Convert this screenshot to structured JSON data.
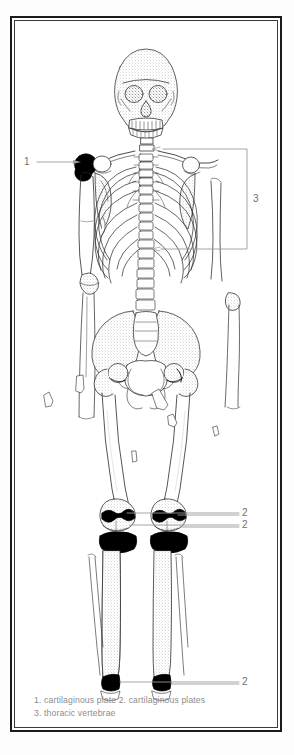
{
  "figure": {
    "kind": "anatomical-line-drawing",
    "background_color": "#ffffff",
    "ink_color": "#2b2b2b",
    "highlight_color": "#000000",
    "label_color": "#6f6f6f",
    "caption_color": "#8c8c8c"
  },
  "labels": [
    {
      "id": "label-1",
      "text": "1",
      "x": 24,
      "y": 141
    },
    {
      "id": "label-3",
      "text": "3",
      "x": 242,
      "y": 186
    },
    {
      "id": "label-2a",
      "text": "2",
      "x": 228,
      "y": 470
    },
    {
      "id": "label-2b",
      "text": "2",
      "x": 228,
      "y": 492
    },
    {
      "id": "label-2c",
      "text": "2",
      "x": 228,
      "y": 645
    }
  ],
  "caption": {
    "line1": "1. cartilaginous plate 2. cartilaginous plates",
    "line2": "3. thoracic vertebrae"
  },
  "legend_keys": [
    {
      "key": "1",
      "term": "cartilaginous plate"
    },
    {
      "key": "2",
      "term": "cartilaginous plates"
    },
    {
      "key": "3",
      "term": "thoracic vertebrae"
    }
  ],
  "callouts": {
    "one": {
      "target": "left shoulder / proximal humerus epiphysis"
    },
    "two_knee_upper": {
      "target": "distal femur epiphyseal plate"
    },
    "two_knee_lower": {
      "target": "proximal tibia epiphyseal plate"
    },
    "two_ankle": {
      "target": "distal tibia epiphyseal plate"
    },
    "three": {
      "target": "thoracic vertebrae / rib cage region bracket"
    }
  },
  "parts": [
    "skull",
    "clavicles",
    "scapulae",
    "humeri",
    "radii",
    "ulnae",
    "rib cage",
    "sternum",
    "vertebral column",
    "pelvis",
    "femora",
    "patellae",
    "tibiae",
    "fibulae",
    "loose bone fragments"
  ]
}
